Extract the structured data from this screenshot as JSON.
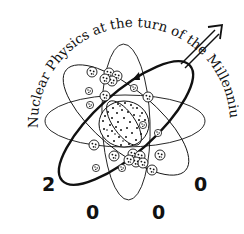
{
  "logo": {
    "title_arc": "Nuclear Physics at the turn of the Millennium",
    "year_digits": [
      "2",
      "0",
      "0",
      "0"
    ],
    "colors": {
      "ink": "#111111",
      "background": "#ffffff"
    }
  }
}
